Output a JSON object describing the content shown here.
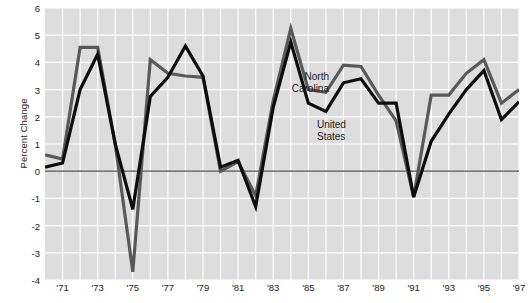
{
  "chart_data": {
    "type": "line",
    "title": "",
    "xlabel": "",
    "ylabel": "Percent Change",
    "xlim": [
      1970,
      1997
    ],
    "ylim": [
      -4,
      6
    ],
    "grid": true,
    "legend_position": "inline-annotations",
    "x": [
      1970,
      1971,
      1972,
      1973,
      1974,
      1975,
      1976,
      1977,
      1978,
      1979,
      1980,
      1981,
      1982,
      1983,
      1984,
      1985,
      1986,
      1987,
      1988,
      1989,
      1990,
      1991,
      1992,
      1993,
      1994,
      1995,
      1996,
      1997
    ],
    "x_tick_labels": [
      "'71",
      "'73",
      "'75",
      "'77",
      "'79",
      "'81",
      "'83",
      "'85",
      "'87",
      "'89",
      "'91",
      "'93",
      "'95",
      "'97"
    ],
    "x_tick_values": [
      1971,
      1973,
      1975,
      1977,
      1979,
      1981,
      1983,
      1985,
      1987,
      1989,
      1991,
      1993,
      1995,
      1997
    ],
    "y_tick_labels": [
      "6",
      "5",
      "4",
      "3",
      "2",
      "1",
      "0",
      "-1",
      "-2",
      "-3",
      "-4"
    ],
    "y_tick_values": [
      6,
      5,
      4,
      3,
      2,
      1,
      0,
      -1,
      -2,
      -3,
      -4
    ],
    "series": [
      {
        "name": "North Carolina",
        "color": "#595959",
        "values": [
          0.6,
          0.45,
          4.55,
          4.55,
          1.0,
          -3.7,
          4.1,
          3.6,
          3.5,
          3.45,
          0.0,
          0.35,
          -0.9,
          2.6,
          5.25,
          3.0,
          2.9,
          3.9,
          3.85,
          2.8,
          1.85,
          -0.95,
          2.8,
          2.8,
          3.6,
          4.1,
          2.5,
          3.0
        ]
      },
      {
        "name": "United States",
        "color": "#0d0d0d",
        "values": [
          0.15,
          0.3,
          3.0,
          4.3,
          1.0,
          -1.4,
          2.75,
          3.45,
          4.6,
          3.5,
          0.15,
          0.4,
          -1.3,
          2.35,
          4.75,
          2.5,
          2.2,
          3.25,
          3.4,
          2.5,
          2.5,
          -0.95,
          1.1,
          2.1,
          3.0,
          3.7,
          1.9,
          2.55
        ]
      }
    ],
    "annotations": [
      {
        "text_line1": "North",
        "text_line2": "Carolina",
        "series": "North Carolina"
      },
      {
        "text_line1": "United",
        "text_line2": "States",
        "series": "United States"
      }
    ],
    "zero_line": 0,
    "plot_background": "#dddddd",
    "gridline_color": "#ffffff",
    "zero_line_color": "#4d4d4d"
  },
  "axis": {
    "y_title": "Percent Change"
  },
  "labels": {
    "north_carolina_line1": "North",
    "north_carolina_line2": "Carolina",
    "united_states_line1": "United",
    "united_states_line2": "States"
  }
}
